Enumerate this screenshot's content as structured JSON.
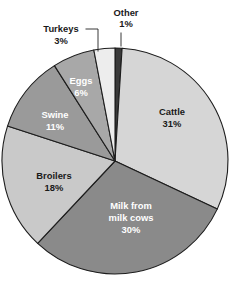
{
  "chart_data": {
    "type": "pie",
    "title": "",
    "subtitle": "",
    "xlabel": "",
    "ylabel": "",
    "legend_position": "none",
    "grid": false,
    "start_angle_deg": 0,
    "direction": "clockwise",
    "units": "percent",
    "categories": [
      "Other",
      "Cattle",
      "Milk from milk cows",
      "Broilers",
      "Swine",
      "Eggs",
      "Turkeys"
    ],
    "values": [
      1,
      31,
      30,
      18,
      11,
      6,
      3
    ],
    "slices": [
      {
        "name": "Other",
        "label_line1": "Other",
        "label_line2": "1%",
        "value": 1,
        "value_text": "1%",
        "color": "#3a3a3a",
        "label_placement": "outside",
        "label_x": 126,
        "label_y": 14,
        "label_x2": 126,
        "label_y2": 25,
        "leader": "M 121 33 L 121 46"
      },
      {
        "name": "Cattle",
        "label_line1": "Cattle",
        "label_line2": "31%",
        "value": 31,
        "value_text": "31%",
        "color": "#d6d6d6",
        "label_placement": "inside",
        "label_tone": "light",
        "label_x": 172,
        "label_y": 113,
        "label_x2": 172,
        "label_y2": 125,
        "leader": ""
      },
      {
        "name": "Milk from milk cows",
        "label_line1": "Milk from",
        "label_line2": "milk cows",
        "label_line3": "30%",
        "value": 30,
        "value_text": "30%",
        "color": "#8a8a8a",
        "label_placement": "inside",
        "label_tone": "dark",
        "label_x": 131,
        "label_y": 207,
        "label_x2": 131,
        "label_y2": 219,
        "label_x3": 131,
        "label_y3": 231,
        "leader": ""
      },
      {
        "name": "Broilers",
        "label_line1": "Broilers",
        "label_line2": "18%",
        "value": 18,
        "value_text": "18%",
        "color": "#c9c9c9",
        "label_placement": "inside",
        "label_tone": "light",
        "label_x": 54,
        "label_y": 177,
        "label_x2": 54,
        "label_y2": 189,
        "leader": ""
      },
      {
        "name": "Swine",
        "label_line1": "Swine",
        "label_line2": "11%",
        "value": 11,
        "value_text": "11%",
        "color": "#9a9a9a",
        "label_placement": "inside",
        "label_tone": "dark",
        "label_x": 55,
        "label_y": 116,
        "label_x2": 55,
        "label_y2": 128,
        "leader": ""
      },
      {
        "name": "Eggs",
        "label_line1": "Eggs",
        "label_line2": "6%",
        "value": 6,
        "value_text": "6%",
        "color": "#a8a8a8",
        "label_placement": "inside",
        "label_tone": "dark",
        "label_x": 81,
        "label_y": 82,
        "label_x2": 81,
        "label_y2": 94,
        "leader": ""
      },
      {
        "name": "Turkeys",
        "label_line1": "Turkeys",
        "label_line2": "3%",
        "value": 3,
        "value_text": "3%",
        "color": "#ededed",
        "label_placement": "outside",
        "label_x": 61,
        "label_y": 30,
        "label_x2": 61,
        "label_y2": 42,
        "leader": "M 86 29 L 98 29 L 98 51"
      }
    ],
    "geometry": {
      "cx": 115,
      "cy": 161,
      "r": 113
    }
  }
}
